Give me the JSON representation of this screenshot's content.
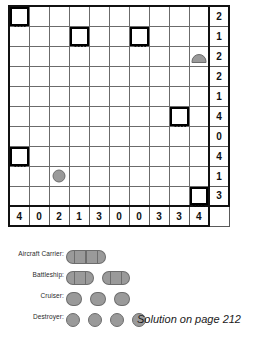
{
  "puzzle": {
    "type": "battleships-bimaru",
    "grid_size": 10,
    "row_clues": [
      2,
      1,
      2,
      2,
      1,
      4,
      0,
      4,
      1,
      3
    ],
    "col_clues": [
      4,
      0,
      2,
      1,
      3,
      0,
      0,
      3,
      3,
      4
    ],
    "given_cells": [
      {
        "row": 0,
        "col": 0,
        "kind": "water"
      },
      {
        "row": 1,
        "col": 3,
        "kind": "water"
      },
      {
        "row": 1,
        "col": 6,
        "kind": "water"
      },
      {
        "row": 2,
        "col": 9,
        "kind": "ship-top"
      },
      {
        "row": 5,
        "col": 8,
        "kind": "water"
      },
      {
        "row": 7,
        "col": 0,
        "kind": "water"
      },
      {
        "row": 8,
        "col": 2,
        "kind": "ship-single"
      },
      {
        "row": 9,
        "col": 9,
        "kind": "water"
      }
    ]
  },
  "legend": {
    "rows": [
      {
        "label": "Aircraft Carrier:",
        "count": 1,
        "length": 4
      },
      {
        "label": "Battleship:",
        "count": 2,
        "length": 3
      },
      {
        "label": "Cruiser:",
        "count": 3,
        "length": 2
      },
      {
        "label": "Destroyer:",
        "count": 4,
        "length": 1
      }
    ]
  },
  "footer": {
    "solution_note": "Solution on page 212"
  },
  "colors": {
    "ship_fill": "#9a9a9a",
    "ship_stroke": "#6d6d6d",
    "grid_line": "#6b6b6b",
    "frame": "#111111",
    "text": "#1a1a1a"
  }
}
